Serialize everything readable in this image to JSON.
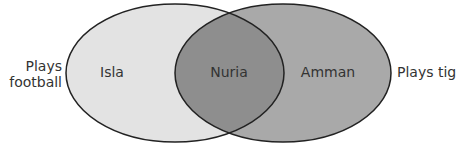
{
  "diagram": {
    "type": "venn",
    "sets": [
      {
        "id": "football",
        "label_line1": "Plays",
        "label_line2": "football",
        "only_members": [
          "Isla"
        ],
        "fill": "#e3e3e3"
      },
      {
        "id": "tig",
        "label": "Plays tig",
        "only_members": [
          "Amman"
        ],
        "fill": "#a9a9a9"
      }
    ],
    "intersection": {
      "members": [
        "Nuria"
      ],
      "fill": "#8e8e8e"
    },
    "outline_color": "#222222"
  }
}
